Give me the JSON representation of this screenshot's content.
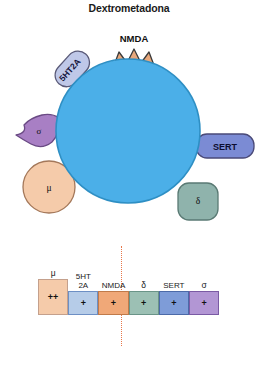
{
  "title": "Dextrometadona",
  "colors": {
    "core": "#4BAFE8",
    "core_stroke": "#2E8FC4",
    "nmda": "#E8A87C",
    "nmda_stroke": "#3a3a3a",
    "ht2a": "#BFC8E8",
    "ht2a_stroke": "#5a5a78",
    "sert": "#7B8BD4",
    "sert_stroke": "#4a4a78",
    "sigma": "#A87FC4",
    "sigma_stroke": "#6a4a84",
    "mu": "#F5CBAA",
    "mu_stroke": "#A4785A",
    "delta": "#8FB3AC",
    "delta_stroke": "#5a7a74",
    "dotted": "#E8774A"
  },
  "diagram": {
    "core_label": "",
    "receptors": [
      {
        "id": "nmda",
        "label": "NMDA",
        "caption": "NMDA",
        "shape": "crown"
      },
      {
        "id": "ht2a",
        "label": "5HT2A",
        "caption": "",
        "shape": "capsule"
      },
      {
        "id": "sert",
        "label": "SERT",
        "caption": "",
        "shape": "capsule"
      },
      {
        "id": "sigma",
        "label": "σ",
        "caption": "",
        "shape": "blob"
      },
      {
        "id": "mu",
        "label": "μ",
        "caption": "",
        "shape": "circle"
      },
      {
        "id": "delta",
        "label": "δ",
        "caption": "",
        "shape": "rounded-square"
      }
    ]
  },
  "table": {
    "columns": [
      {
        "key": "mu",
        "label": "μ",
        "value": "++",
        "fill": "#F5CBAA",
        "stroke": "#C4A08C",
        "tall": true
      },
      {
        "key": "ht2a",
        "label": "5HT\n2A",
        "value": "+",
        "fill": "#B6CCE8",
        "stroke": "#6D8FC4",
        "tall": false
      },
      {
        "key": "nmda",
        "label": "NMDA",
        "value": "+",
        "fill": "#F0A878",
        "stroke": "#C07A4A",
        "tall": false
      },
      {
        "key": "delta",
        "label": "δ",
        "value": "+",
        "fill": "#9CC0B4",
        "stroke": "#6A9488",
        "tall": false
      },
      {
        "key": "sert",
        "label": "SERT",
        "value": "+",
        "fill": "#7E9CD8",
        "stroke": "#4C6AA8",
        "tall": false
      },
      {
        "key": "sigma",
        "label": "σ",
        "value": "+",
        "fill": "#B296D4",
        "stroke": "#7A5AA4",
        "tall": false
      }
    ]
  }
}
